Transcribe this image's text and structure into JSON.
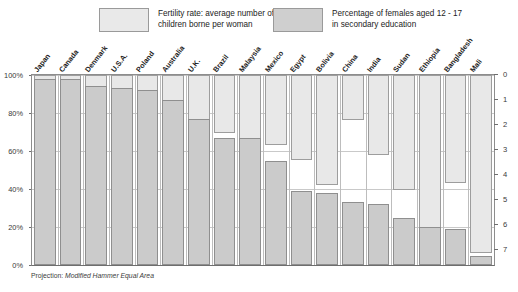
{
  "legend": {
    "fertility": {
      "label": "Fertility rate: average number of\nchildren borne per woman",
      "color": "#e8e8e8"
    },
    "education": {
      "label": "Percentage of females aged 12 - 17\nin secondary education",
      "color": "#cbcbcb"
    }
  },
  "footnote": {
    "lead": "Projection: ",
    "text": "Modified Hammer Equal Area",
    "full": "Projection: Modified Hammer Equal Area"
  },
  "axes": {
    "left": {
      "title": "",
      "ticks": [
        "100%",
        "80%",
        "60%",
        "40%",
        "20%",
        "0%"
      ],
      "values": [
        100,
        80,
        60,
        40,
        20,
        0
      ],
      "min": 0,
      "max": 100
    },
    "right": {
      "title": "",
      "ticks": [
        "0",
        "1",
        "2",
        "3",
        "4",
        "5",
        "6",
        "7"
      ],
      "values": [
        0,
        1,
        2,
        3,
        4,
        5,
        6,
        7
      ],
      "min": 0,
      "max": 7
    }
  },
  "chart_data": {
    "type": "bar",
    "title": "",
    "subtitle": "",
    "xlabel": "",
    "ylabel": "Percentage of females aged 12 - 17 in secondary education",
    "y2label": "Fertility rate: average number of children borne per woman",
    "ylim": [
      0,
      100
    ],
    "y2lim": [
      0,
      7.6
    ],
    "grid": true,
    "legend_position": "top",
    "categories": [
      "Japan",
      "Canada",
      "Denmark",
      "U.S.A.",
      "Poland",
      "Australia",
      "U.K.",
      "Brazil",
      "Malaysia",
      "Mexico",
      "Egypt",
      "Bolivia",
      "China",
      "India",
      "Sudan",
      "Ethiopia",
      "Bangladesh",
      "Mali"
    ],
    "series": [
      {
        "name": "Percentage of females aged 12 - 17 in secondary education",
        "axis": "left",
        "unit": "%",
        "direction": "up",
        "color": "#cbcbcb",
        "values": [
          98,
          98,
          94,
          93,
          92,
          87,
          77,
          67,
          67,
          55,
          39,
          38,
          33,
          32,
          25,
          20,
          19,
          5
        ]
      },
      {
        "name": "Fertility rate: average number of children borne per woman",
        "axis": "right",
        "unit": "children per woman",
        "direction": "down",
        "color": "#e8e8e8",
        "values": [
          1.5,
          1.8,
          1.7,
          2.1,
          1.6,
          1.8,
          1.8,
          2.3,
          3.2,
          2.8,
          3.4,
          4.4,
          1.8,
          3.2,
          4.6,
          7.0,
          4.3,
          7.1
        ]
      }
    ]
  }
}
